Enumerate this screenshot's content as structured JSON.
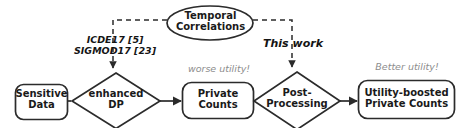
{
  "figure": {
    "colors": {
      "stroke": "#2b2b2b",
      "text": "#1a1a1a",
      "muted": "#8d8d8d",
      "background": "#ffffff"
    },
    "nodes": {
      "sensitive_data": {
        "line1": "Sensitive",
        "line2": "Data"
      },
      "enhanced_dp": {
        "line1": "enhanced",
        "line2": "DP"
      },
      "private_counts": {
        "line1": "Private",
        "line2": "Counts"
      },
      "post_processing": {
        "line1": "Post-",
        "line2": "Processing"
      },
      "utility_boosted": {
        "line1": "Utility-boosted",
        "line2": "Private Counts"
      },
      "temporal_correlations": {
        "line1": "Temporal",
        "line2": "Correlations"
      }
    },
    "annotations": {
      "citations": {
        "line1": "ICDE17 [5]",
        "line2": "SIGMOD17 [23]"
      },
      "this_work": "This work",
      "worse_utility": "worse utility!",
      "better_utility": "Better utility!"
    }
  }
}
